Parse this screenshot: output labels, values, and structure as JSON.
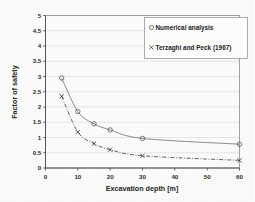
{
  "chart_data": {
    "type": "line",
    "title": "",
    "xlabel": "Excavation depth [m]",
    "ylabel": "Factor of safety",
    "xlim": [
      0,
      60
    ],
    "ylim": [
      0,
      5
    ],
    "xticks": [
      "0",
      "10",
      "20",
      "30",
      "40",
      "50",
      "60"
    ],
    "xtick_values": [
      0,
      10,
      20,
      30,
      40,
      50,
      60
    ],
    "yticks": [
      "0",
      "0.5",
      "1",
      "1.5",
      "2",
      "2.5",
      "3",
      "3.5",
      "4",
      "4.5",
      "5"
    ],
    "ytick_values": [
      0,
      0.5,
      1,
      1.5,
      2,
      2.5,
      3,
      3.5,
      4,
      4.5,
      5
    ],
    "grid": "horizontal",
    "legend_position": "upper-right",
    "series": [
      {
        "name": "Numerical analysis",
        "marker": "circle",
        "linestyle": "solid",
        "color": "#505050",
        "x": [
          5,
          10,
          15,
          20,
          30,
          60
        ],
        "values": [
          2.95,
          1.85,
          1.45,
          1.25,
          0.97,
          0.78
        ]
      },
      {
        "name": "Terzaghi and Peck (1967)",
        "marker": "x",
        "linestyle": "dash-dot",
        "color": "#303030",
        "x": [
          5,
          10,
          15,
          20,
          30,
          60
        ],
        "values": [
          2.35,
          1.18,
          0.8,
          0.6,
          0.4,
          0.25
        ]
      }
    ]
  },
  "legend": {
    "entries": [
      {
        "label": "Numerical analysis",
        "marker": "circle-marker"
      },
      {
        "label": "Terzaghi and Peck (1967)",
        "marker": "x-marker"
      }
    ]
  },
  "axes": {
    "x_title": "Excavation depth [m]",
    "y_title": "Factor of safety"
  }
}
